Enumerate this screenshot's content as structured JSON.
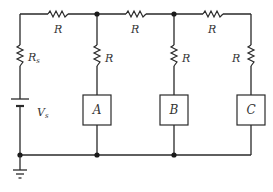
{
  "diagram": {
    "type": "circuit-schematic",
    "source": {
      "resistor_label": "R",
      "resistor_subscript": "s",
      "voltage_label": "V",
      "voltage_subscript": "s"
    },
    "series_resistors": [
      {
        "label": "R"
      },
      {
        "label": "R"
      },
      {
        "label": "R"
      }
    ],
    "shunt_resistors": [
      {
        "label": "R"
      },
      {
        "label": "R"
      },
      {
        "label": "R"
      }
    ],
    "loads": [
      {
        "label": "A"
      },
      {
        "label": "B"
      },
      {
        "label": "C"
      }
    ],
    "ground": "ground-symbol",
    "colors": {
      "line": "#2a2a2a",
      "background": "#ffffff"
    }
  }
}
